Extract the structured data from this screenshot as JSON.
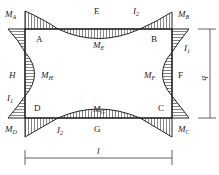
{
  "diagram": {
    "type": "closed rectangular frame bending moment diagram",
    "nodes": {
      "A": "A",
      "B": "B",
      "C": "C",
      "D": "D",
      "E": "E",
      "F": "F",
      "G": "G",
      "H": "H"
    },
    "moments": {
      "MA": {
        "m": "M",
        "s": "A"
      },
      "MB": {
        "m": "M",
        "s": "B"
      },
      "MC": {
        "m": "M",
        "s": "C"
      },
      "MD": {
        "m": "M",
        "s": "D"
      },
      "ME": {
        "m": "M",
        "s": "E"
      },
      "MF": {
        "m": "M",
        "s": "F"
      },
      "MG": {
        "m": "M",
        "s": "G"
      },
      "MH": {
        "m": "M",
        "s": "H"
      }
    },
    "inertia": {
      "top": {
        "m": "I",
        "s": "2"
      },
      "bottom": {
        "m": "I",
        "s": "2"
      },
      "left": {
        "m": "I",
        "s": "1"
      },
      "right": {
        "m": "I",
        "s": "1"
      }
    },
    "dimensions": {
      "width": "l",
      "height": "b"
    },
    "colors": {
      "line": "#222222",
      "hatch": "#333333",
      "background": "#ffffff"
    }
  }
}
